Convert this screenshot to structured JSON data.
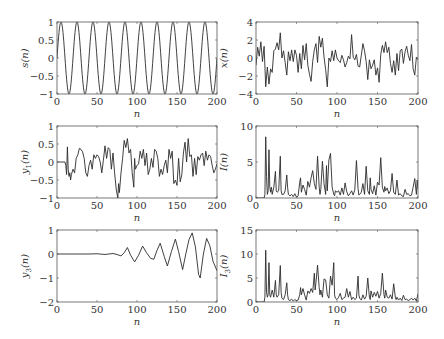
{
  "chart_data": [
    {
      "id": "s",
      "type": "line",
      "ylabel": "s(n)",
      "ylabel_main": "s",
      "ylabel_sub": "",
      "xlabel": "n",
      "xlim": [
        0,
        200
      ],
      "ylim": [
        -1,
        1
      ],
      "xticks": [
        0,
        50,
        100,
        150,
        200
      ],
      "yticks": [
        -1,
        -0.5,
        0,
        0.5,
        1
      ],
      "ytick_labels": [
        "−1",
        "−0.5",
        "0",
        "0.5",
        "1"
      ],
      "generator": "sine",
      "period": 20,
      "amplitude": 1,
      "x": [],
      "y": []
    },
    {
      "id": "x",
      "type": "line",
      "ylabel": "x(n)",
      "ylabel_main": "x",
      "ylabel_sub": "",
      "xlabel": "n",
      "xlim": [
        0,
        200
      ],
      "ylim": [
        -4,
        4
      ],
      "xticks": [
        0,
        50,
        100,
        150,
        200
      ],
      "yticks": [
        -4,
        -2,
        0,
        2,
        4
      ],
      "ytick_labels": [
        "−4",
        "−2",
        "0",
        "2",
        "4"
      ],
      "x": [
        0,
        2,
        4,
        6,
        8,
        10,
        12,
        14,
        16,
        18,
        20,
        22,
        24,
        26,
        28,
        30,
        32,
        34,
        36,
        38,
        40,
        42,
        44,
        46,
        48,
        50,
        52,
        54,
        56,
        58,
        60,
        62,
        64,
        66,
        68,
        70,
        72,
        74,
        76,
        78,
        80,
        82,
        84,
        86,
        88,
        90,
        92,
        94,
        96,
        98,
        100,
        102,
        104,
        106,
        108,
        110,
        112,
        114,
        116,
        118,
        120,
        122,
        124,
        126,
        128,
        130,
        132,
        134,
        136,
        138,
        140,
        142,
        144,
        146,
        148,
        150,
        152,
        154,
        156,
        158,
        160,
        162,
        164,
        166,
        168,
        170,
        172,
        174,
        176,
        178,
        180,
        182,
        184,
        186,
        188,
        190,
        192,
        194,
        196,
        198,
        200
      ],
      "y": [
        -0.8,
        1.2,
        0.2,
        1.8,
        -0.4,
        1.3,
        -3.2,
        -1.0,
        -2.9,
        -1.2,
        -1.6,
        0.8,
        1.0,
        1.7,
        0.9,
        2.8,
        0.0,
        0.8,
        -0.5,
        -1.9,
        0.7,
        -0.3,
        0.9,
        -0.4,
        0.9,
        0.3,
        -1.6,
        0.5,
        -1.2,
        1.4,
        -0.2,
        1.6,
        -0.8,
        -1.8,
        -2.6,
        -0.4,
        0.9,
        1.6,
        -0.5,
        2.4,
        1.2,
        2.2,
        0.1,
        -1.3,
        -3.2,
        0.0,
        -0.4,
        0.8,
        -0.3,
        0.9,
        0.0,
        -0.3,
        -0.5,
        0.3,
        -0.2,
        -1.0,
        -0.5,
        0.2,
        -0.1,
        2.6,
        0.1,
        -0.2,
        0.4,
        -0.9,
        -1.0,
        0.3,
        1.6,
        0.8,
        -0.4,
        -2.4,
        -0.2,
        -1.2,
        -0.8,
        -0.2,
        -1.9,
        -1.1,
        -2.7,
        0.4,
        1.4,
        0.6,
        1.8,
        0.6,
        1.2,
        -0.6,
        -1.6,
        -0.3,
        -1.9,
        0.5,
        -1.4,
        0.8,
        1.0,
        -0.6,
        0.7,
        1.3,
        0.3,
        -0.3,
        1.5,
        -1.2,
        -1.9,
        0.1,
        -0.2
      ]
    },
    {
      "id": "y1",
      "type": "line",
      "ylabel": "y1(n)",
      "ylabel_main": "y",
      "ylabel_sub": "1",
      "xlabel": "n",
      "xlim": [
        0,
        200
      ],
      "ylim": [
        -1,
        1
      ],
      "xticks": [
        0,
        50,
        100,
        150,
        200
      ],
      "yticks": [
        -1,
        -0.5,
        0,
        0.5,
        1
      ],
      "ytick_labels": [
        "−1",
        "−0.5",
        "0",
        "0.5",
        "1"
      ],
      "x": [
        0,
        10,
        11,
        12,
        13,
        14,
        15,
        16,
        17,
        18,
        20,
        22,
        24,
        26,
        28,
        30,
        32,
        34,
        36,
        38,
        40,
        42,
        44,
        46,
        48,
        50,
        52,
        54,
        56,
        58,
        60,
        62,
        64,
        66,
        68,
        70,
        72,
        74,
        76,
        77,
        78,
        80,
        82,
        84,
        86,
        88,
        90,
        92,
        94,
        96,
        97,
        98,
        100,
        102,
        104,
        106,
        108,
        110,
        112,
        114,
        116,
        118,
        120,
        122,
        124,
        126,
        128,
        130,
        132,
        134,
        136,
        138,
        140,
        142,
        144,
        146,
        148,
        150,
        152,
        154,
        156,
        158,
        160,
        162,
        164,
        166,
        168,
        170,
        172,
        174,
        176,
        178,
        180,
        182,
        184,
        186,
        188,
        190,
        192,
        194,
        196,
        198,
        200
      ],
      "y": [
        0,
        0,
        -0.1,
        -0.35,
        0.42,
        -0.2,
        -0.4,
        -0.3,
        -0.5,
        -0.35,
        -0.2,
        -0.3,
        0.1,
        0.2,
        0.38,
        0.35,
        0.28,
        0.1,
        -0.3,
        -0.4,
        -0.1,
        0.05,
        -0.2,
        0.2,
        0.1,
        0.2,
        0.15,
        0.0,
        -0.3,
        0.05,
        0.45,
        0.1,
        0.4,
        0.35,
        -0.2,
        0.25,
        -0.3,
        -0.75,
        -1.0,
        -0.6,
        -0.85,
        -0.3,
        0.1,
        0.6,
        0.4,
        0.65,
        0.25,
        0.35,
        -0.3,
        -0.7,
        0.1,
        -0.2,
        -0.1,
        -0.05,
        0.3,
        0.1,
        0.35,
        -0.1,
        0.25,
        -0.35,
        -0.2,
        0.1,
        -0.15,
        0.35,
        0.3,
        0.1,
        -0.4,
        -0.2,
        -0.35,
        -0.1,
        0.05,
        -0.3,
        0.35,
        0.1,
        0.3,
        -0.6,
        -0.5,
        -0.65,
        0.1,
        -0.55,
        -0.35,
        0.25,
        0.55,
        0.0,
        0.65,
        0.15,
        0.2,
        -0.4,
        0.1,
        -0.35,
        0.15,
        0.05,
        0.2,
        0.25,
        -0.1,
        0.3,
        0.05,
        0.2,
        0.15,
        -0.1,
        -0.3,
        -0.2,
        -0.05
      ]
    },
    {
      "id": "I",
      "type": "line",
      "ylabel": "I(n)",
      "ylabel_main": "I",
      "ylabel_sub": "",
      "xlabel": "n",
      "xlim": [
        0,
        200
      ],
      "ylim": [
        0,
        10
      ],
      "xticks": [
        0,
        50,
        100,
        150,
        200
      ],
      "yticks": [
        0,
        5,
        10
      ],
      "ytick_labels": [
        "0",
        "5",
        "10"
      ],
      "x": [
        0,
        10,
        11,
        12,
        13,
        14,
        15,
        16,
        17,
        18,
        19,
        20,
        22,
        24,
        25,
        26,
        28,
        30,
        31,
        32,
        34,
        36,
        38,
        39,
        40,
        42,
        44,
        46,
        48,
        50,
        52,
        54,
        55,
        56,
        58,
        60,
        62,
        64,
        66,
        68,
        70,
        72,
        74,
        76,
        78,
        79,
        80,
        82,
        84,
        86,
        87,
        88,
        90,
        92,
        94,
        96,
        97,
        98,
        100,
        102,
        104,
        106,
        108,
        110,
        112,
        114,
        116,
        118,
        120,
        122,
        124,
        126,
        127,
        128,
        130,
        132,
        134,
        136,
        138,
        140,
        141,
        142,
        144,
        146,
        148,
        150,
        152,
        154,
        156,
        158,
        159,
        160,
        162,
        164,
        166,
        168,
        170,
        172,
        174,
        176,
        178,
        180,
        182,
        184,
        186,
        188,
        190,
        192,
        194,
        196,
        198,
        199,
        200
      ],
      "y": [
        0,
        0,
        0.5,
        8.5,
        3,
        0.5,
        1,
        6.7,
        1.5,
        0.8,
        1.5,
        0.5,
        1.5,
        3.7,
        1,
        0.8,
        1,
        5.8,
        1,
        0.5,
        0.5,
        1,
        3.2,
        1.5,
        0.5,
        0.3,
        0.5,
        0.2,
        0.6,
        0.1,
        0.3,
        2.2,
        2.8,
        0.8,
        1.8,
        1.2,
        0.4,
        2.3,
        1.5,
        2.8,
        3.8,
        2,
        1.2,
        5.8,
        1.5,
        0.5,
        1.2,
        5.1,
        2,
        0.5,
        4.5,
        1,
        5.3,
        6.2,
        1.5,
        0.5,
        0.3,
        1,
        0.8,
        1,
        0.4,
        1.4,
        0.5,
        2.1,
        0.9,
        0.3,
        0.6,
        1,
        0.4,
        1.2,
        5.2,
        1.3,
        0.4,
        0.5,
        0.8,
        2,
        0.5,
        4.4,
        1,
        0.5,
        2.8,
        1.2,
        0.6,
        1.7,
        0.4,
        2.2,
        1.8,
        5.6,
        1.5,
        0.8,
        1.6,
        1,
        1.4,
        0.6,
        1,
        3.4,
        0.8,
        0.5,
        2.5,
        0.4,
        0.6,
        0.3,
        0.2,
        1.2,
        0.5,
        0.6,
        0.3,
        0.4,
        1.5,
        2.7,
        0.5,
        2.5,
        1.2
      ]
    },
    {
      "id": "y3",
      "type": "line",
      "ylabel": "y3(n)",
      "ylabel_main": "y",
      "ylabel_sub": "3",
      "xlabel": "n",
      "xlim": [
        0,
        200
      ],
      "ylim": [
        -2,
        1
      ],
      "xticks": [
        0,
        50,
        100,
        150,
        200
      ],
      "yticks": [
        -2,
        -1,
        0,
        1
      ],
      "ytick_labels": [
        "−2",
        "−1",
        "0",
        "1"
      ],
      "x": [
        0,
        20,
        40,
        50,
        60,
        70,
        75,
        80,
        84,
        88,
        92,
        97,
        102,
        107,
        112,
        117,
        121,
        125,
        129,
        134,
        138,
        143,
        148,
        152,
        157,
        161,
        165,
        169,
        173,
        177,
        179,
        183,
        187,
        191,
        195,
        200
      ],
      "y": [
        0,
        0,
        0,
        0.01,
        -0.02,
        0.02,
        -0.02,
        -0.08,
        0.05,
        0.27,
        -0.05,
        -0.33,
        -0.05,
        0.33,
        0.05,
        -0.18,
        -0.22,
        0.15,
        0.45,
        -0.1,
        -0.5,
        0.1,
        0.62,
        0.1,
        -0.65,
        0.0,
        0.6,
        0.88,
        0.3,
        -0.85,
        -1.0,
        0.0,
        0.65,
        0.35,
        -0.3,
        -0.7
      ]
    },
    {
      "id": "I3",
      "type": "line",
      "ylabel": "I3(n)",
      "ylabel_main": "I",
      "ylabel_sub": "3",
      "xlabel": "n",
      "xlim": [
        0,
        200
      ],
      "ylim": [
        0,
        15
      ],
      "xticks": [
        0,
        50,
        100,
        150,
        200
      ],
      "yticks": [
        0,
        5,
        10,
        15
      ],
      "ytick_labels": [
        "0",
        "5",
        "10",
        "15"
      ],
      "x": [
        0,
        10,
        11,
        12,
        13,
        14,
        15,
        16,
        17,
        18,
        20,
        22,
        24,
        25,
        26,
        28,
        30,
        31,
        32,
        34,
        36,
        38,
        39,
        40,
        42,
        44,
        46,
        48,
        50,
        52,
        54,
        55,
        56,
        58,
        60,
        62,
        64,
        66,
        68,
        70,
        72,
        73,
        74,
        76,
        78,
        79,
        80,
        82,
        84,
        86,
        88,
        90,
        92,
        94,
        96,
        97,
        98,
        100,
        102,
        104,
        106,
        108,
        110,
        112,
        114,
        116,
        118,
        120,
        122,
        124,
        126,
        127,
        128,
        130,
        132,
        134,
        136,
        138,
        140,
        141,
        142,
        144,
        146,
        148,
        150,
        152,
        154,
        156,
        158,
        159,
        160,
        162,
        164,
        166,
        168,
        170,
        172,
        173,
        174,
        176,
        178,
        180,
        182,
        184,
        186,
        188,
        190,
        192,
        194,
        196,
        198,
        200
      ],
      "y": [
        0,
        0,
        1,
        10.8,
        2,
        1,
        1.5,
        8.2,
        1.5,
        1,
        2.5,
        1,
        4.5,
        1.5,
        1,
        1.5,
        7.6,
        2,
        0.8,
        0.5,
        1.5,
        4,
        1.5,
        0.5,
        0.3,
        0.6,
        0.2,
        0.5,
        0.3,
        0.4,
        1.5,
        3,
        1.5,
        2.8,
        1.5,
        0.4,
        2.3,
        1.8,
        2.8,
        2,
        6,
        2.5,
        4,
        7.7,
        3,
        1.5,
        2.5,
        1,
        4.8,
        4.6,
        1.5,
        0.8,
        5.4,
        3.5,
        8.2,
        1.5,
        0.8,
        0.5,
        1,
        1.8,
        0.5,
        0.8,
        1,
        2.8,
        1,
        2.2,
        0.5,
        1,
        0.5,
        0.8,
        5.4,
        1.5,
        0.8,
        0.4,
        1.5,
        0.6,
        1.2,
        5,
        1,
        0.5,
        2.3,
        1,
        2,
        1.2,
        2.2,
        0.8,
        1.8,
        6,
        1.5,
        0.8,
        2.5,
        1,
        0.8,
        1.5,
        0.6,
        3.8,
        1,
        0.5,
        1,
        0.4,
        0.8,
        0.3,
        1.4,
        0.5,
        0.6,
        0.3,
        0.5,
        0.8,
        0.4,
        0.8,
        0.2,
        1.7
      ]
    }
  ],
  "layout": {
    "panels": [
      {
        "chart": 0,
        "x0": 57,
        "y0": 22,
        "w": 160,
        "h": 72
      },
      {
        "chart": 1,
        "x0": 256,
        "y0": 22,
        "w": 162,
        "h": 72
      },
      {
        "chart": 2,
        "x0": 57,
        "y0": 126,
        "w": 160,
        "h": 72
      },
      {
        "chart": 3,
        "x0": 256,
        "y0": 126,
        "w": 162,
        "h": 72
      },
      {
        "chart": 4,
        "x0": 57,
        "y0": 230,
        "w": 160,
        "h": 72
      },
      {
        "chart": 5,
        "x0": 256,
        "y0": 230,
        "w": 162,
        "h": 72
      }
    ]
  },
  "colors": {
    "line": "#2b2b2b",
    "axis": "#555555",
    "text": "#333333"
  }
}
